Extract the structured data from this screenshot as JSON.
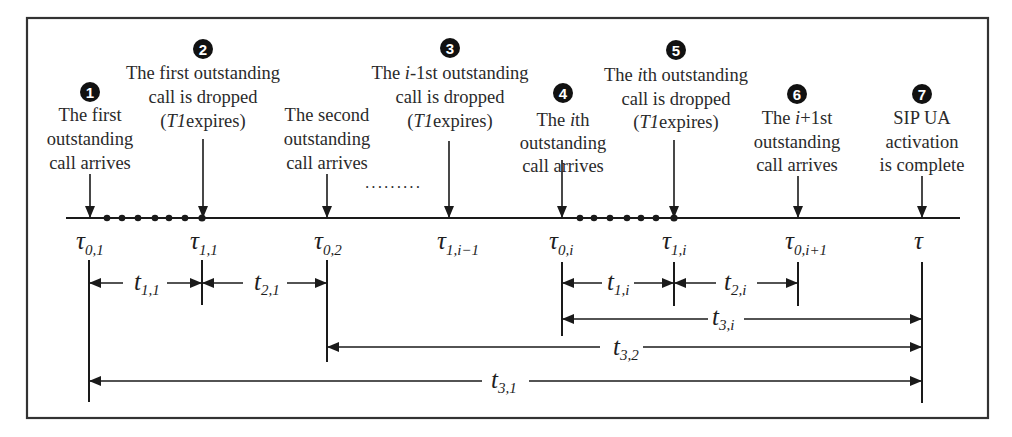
{
  "diagram": {
    "frame": {
      "border_color": "#333333"
    },
    "events": [
      {
        "id": 1,
        "number": "1",
        "lines": [
          "The first",
          "outstanding",
          "call arrives"
        ],
        "point": "τ0,1"
      },
      {
        "id": 2,
        "number": "2",
        "lines": [
          "The first outstanding",
          "call is dropped",
          "(T1expires)"
        ],
        "point": "τ1,1"
      },
      {
        "id": "second",
        "number": "",
        "lines": [
          "The second",
          "outstanding",
          "call arrives"
        ],
        "point": "τ0,2"
      },
      {
        "id": 3,
        "number": "3",
        "lines": [
          "The i-1st outstanding",
          "call is dropped",
          "(T1expires)"
        ],
        "point": "τ1,i−1"
      },
      {
        "id": 4,
        "number": "4",
        "lines": [
          "The ith",
          "outstanding",
          "call arrives"
        ],
        "point": "τ0,i"
      },
      {
        "id": 5,
        "number": "5",
        "lines": [
          "The ith outstanding",
          "call is dropped",
          "(T1expires)"
        ],
        "point": "τ1,i"
      },
      {
        "id": 6,
        "number": "6",
        "lines": [
          "The i+1st",
          "outstanding",
          "call arrives"
        ],
        "point": "τ0,i+1"
      },
      {
        "id": 7,
        "number": "7",
        "lines": [
          "SIP UA",
          "activation",
          "is complete"
        ],
        "point": "τ"
      }
    ],
    "ellipsis": "·········",
    "timeline_points": [
      {
        "sym": "τ",
        "sub": "0,1"
      },
      {
        "sym": "τ",
        "sub": "1,1"
      },
      {
        "sym": "τ",
        "sub": "0,2"
      },
      {
        "sym": "τ",
        "sub": "1,i−1"
      },
      {
        "sym": "τ",
        "sub": "0,i"
      },
      {
        "sym": "τ",
        "sub": "1,i"
      },
      {
        "sym": "τ",
        "sub": "0,i+1"
      },
      {
        "sym": "τ",
        "sub": ""
      }
    ],
    "intervals": [
      {
        "sym": "t",
        "sub": "1,1",
        "from": "τ0,1",
        "to": "τ1,1"
      },
      {
        "sym": "t",
        "sub": "2,1",
        "from": "τ1,1",
        "to": "τ0,2"
      },
      {
        "sym": "t",
        "sub": "1,i",
        "from": "τ0,i",
        "to": "τ1,i"
      },
      {
        "sym": "t",
        "sub": "2,i",
        "from": "τ1,i",
        "to": "τ0,i+1"
      },
      {
        "sym": "t",
        "sub": "3,i",
        "from": "τ0,i",
        "to": "τ"
      },
      {
        "sym": "t",
        "sub": "3,2",
        "from": "τ0,2",
        "to": "τ"
      },
      {
        "sym": "t",
        "sub": "3,1",
        "from": "τ0,1",
        "to": "τ"
      }
    ]
  }
}
